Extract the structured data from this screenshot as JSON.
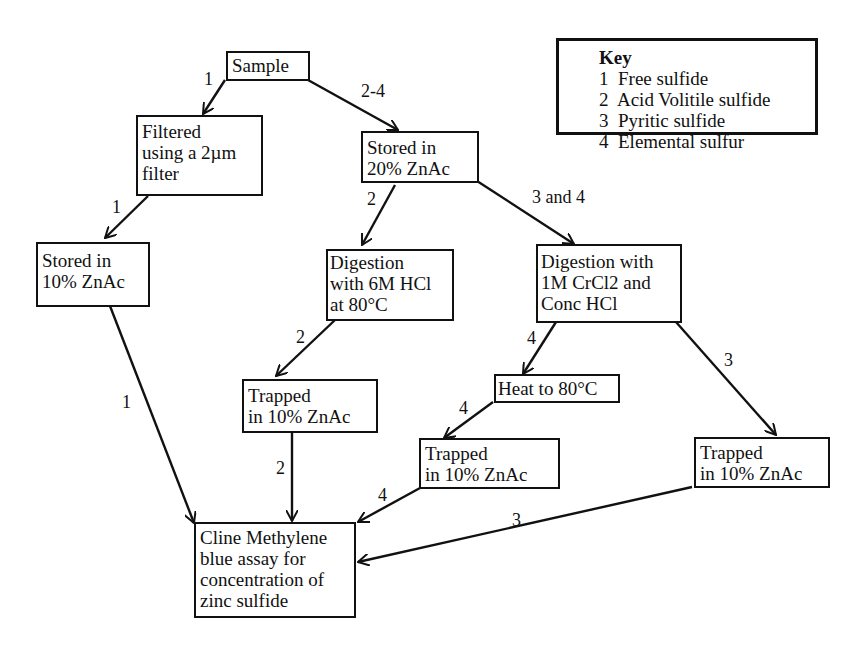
{
  "diagram": {
    "nodes": {
      "sample": "Sample",
      "filtered": "Filtered\nusing a 2µm\nfilter",
      "stored20": "Stored in\n20% ZnAc",
      "stored10": "Stored in\n10% ZnAc",
      "digest_hcl": "Digestion\nwith 6M HCl\nat 80°C",
      "digest_crcl2": "Digestion with\n1M CrCl2 and\nConc HCl",
      "trapped_2": "Trapped\nin 10% ZnAc",
      "heat": "Heat to 80°C",
      "trapped_4": "Trapped\nin 10% ZnAc",
      "trapped_3": "Trapped\nin 10% ZnAc",
      "assay": "Cline Methylene\nblue assay for\nconcentration of\nzinc sulfide"
    },
    "edge_labels": {
      "sample_filtered": "1",
      "sample_stored20": "2-4",
      "filtered_stored10": "1",
      "stored20_digest_hcl": "2",
      "stored20_digest_crcl2": "3 and 4",
      "stored10_assay": "1",
      "digest_hcl_trapped": "2",
      "trapped2_assay": "2",
      "crcl2_heat": "4",
      "crcl2_trapped3": "3",
      "heat_trapped4": "4",
      "trapped4_assay": "4",
      "trapped3_assay": "3"
    },
    "key": {
      "title": "Key",
      "items": [
        "1  Free sulfide",
        "2  Acid Volitile sulfide",
        "3  Pyritic sulfide",
        "4  Elemental sulfur"
      ]
    }
  }
}
